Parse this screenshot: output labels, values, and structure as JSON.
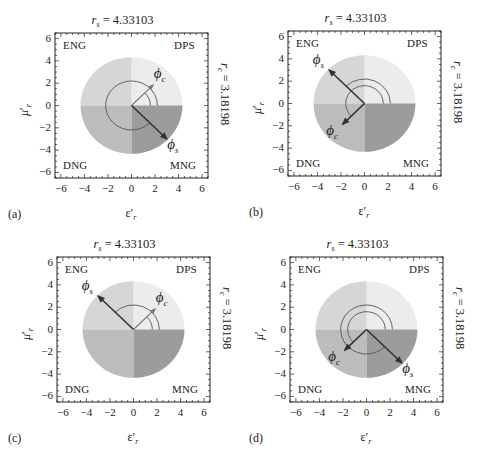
{
  "figure": {
    "colors": {
      "DPS": "#ececec",
      "ENG": "#d6d6d6",
      "DNG": "#bcbcbc",
      "MNG": "#9c9c9c",
      "arrow_dark": "#333333",
      "arrow_gray": "#7a7a7a",
      "arc": "#555555",
      "frame": "#222222"
    }
  },
  "chart_data": [
    {
      "panel": "(a)",
      "type": "scatter",
      "title": "r_s = 4.33103",
      "right_label": "r_c = 3.18198",
      "xlabel": "ε′_r",
      "ylabel": "μ′_r",
      "xlim": [
        -6.5,
        6.5
      ],
      "ylim": [
        -6.5,
        6.5
      ],
      "xticks": [
        -6,
        -4,
        -2,
        0,
        2,
        4,
        6
      ],
      "yticks": [
        -6,
        -4,
        -2,
        0,
        2,
        4,
        6
      ],
      "quadrant_labels": {
        "top_left": "ENG",
        "top_right": "DPS",
        "bottom_left": "DNG",
        "bottom_right": "MNG"
      },
      "disk_radius": 4.33103,
      "phi_c_deg": 45,
      "phi_s_deg": -45,
      "phi_c_arc": {
        "radius": 1.6,
        "from": 0,
        "to": 45
      },
      "phi_s_arc": {
        "radius": 2.2,
        "from": 0,
        "to": 315
      },
      "phi_c_style": "gray",
      "phi_s_style": "dark"
    },
    {
      "panel": "(b)",
      "type": "scatter",
      "title": "r_s = 4.33103",
      "right_label": "r_c = 3.18198",
      "xlabel": "ε′_r",
      "ylabel": "μ′_r",
      "xlim": [
        -6.5,
        6.5
      ],
      "ylim": [
        -6.5,
        6.5
      ],
      "xticks": [
        -6,
        -4,
        -2,
        0,
        2,
        4,
        6
      ],
      "yticks": [
        -6,
        -4,
        -2,
        0,
        2,
        4,
        6
      ],
      "quadrant_labels": {
        "top_left": "ENG",
        "top_right": "DPS",
        "bottom_left": "DNG",
        "bottom_right": "MNG"
      },
      "disk_radius": 4.33103,
      "phi_c_deg": 225,
      "phi_s_deg": 135,
      "phi_c_arc": {
        "radius": 1.6,
        "from": 0,
        "to": 225
      },
      "phi_s_arc": {
        "radius": 2.2,
        "from": 0,
        "to": 135
      },
      "phi_c_style": "dark",
      "phi_s_style": "dark"
    },
    {
      "panel": "(c)",
      "type": "scatter",
      "title": "r_s = 4.33103",
      "right_label": "r_c = 3.18198",
      "xlabel": "ε′_r",
      "ylabel": "μ′_r",
      "xlim": [
        -6.5,
        6.5
      ],
      "ylim": [
        -6.5,
        6.5
      ],
      "xticks": [
        -6,
        -4,
        -2,
        0,
        2,
        4,
        6
      ],
      "yticks": [
        -6,
        -4,
        -2,
        0,
        2,
        4,
        6
      ],
      "quadrant_labels": {
        "top_left": "ENG",
        "top_right": "DPS",
        "bottom_left": "DNG",
        "bottom_right": "MNG"
      },
      "disk_radius": 4.33103,
      "phi_c_deg": 45,
      "phi_s_deg": 135,
      "phi_c_arc": {
        "radius": 1.6,
        "from": 0,
        "to": 45
      },
      "phi_s_arc": {
        "radius": 2.2,
        "from": 0,
        "to": 135
      },
      "phi_c_style": "gray",
      "phi_s_style": "dark"
    },
    {
      "panel": "(d)",
      "type": "scatter",
      "title": "r_s = 4.33103",
      "right_label": "r_c = 3.18198",
      "xlabel": "ε′_r",
      "ylabel": "μ′_r",
      "xlim": [
        -6.5,
        6.5
      ],
      "ylim": [
        -6.5,
        6.5
      ],
      "xticks": [
        -6,
        -4,
        -2,
        0,
        2,
        4,
        6
      ],
      "yticks": [
        -6,
        -4,
        -2,
        0,
        2,
        4,
        6
      ],
      "quadrant_labels": {
        "top_left": "ENG",
        "top_right": "DPS",
        "bottom_left": "DNG",
        "bottom_right": "MNG"
      },
      "disk_radius": 4.33103,
      "phi_c_deg": 225,
      "phi_s_deg": -45,
      "phi_c_arc": {
        "radius": 1.6,
        "from": 0,
        "to": 225
      },
      "phi_s_arc": {
        "radius": 2.2,
        "from": 0,
        "to": 315
      },
      "phi_c_style": "dark",
      "phi_s_style": "dark"
    }
  ],
  "panels": [
    {
      "tag": "(a)",
      "title_r": "r",
      "title_sub": "s",
      "title_val": " = 4.33103",
      "right_r": "r",
      "right_sub": "c",
      "right_val": " = 3.18198",
      "x_sym": "ε",
      "y_sym": "μ",
      "prime": "′",
      "axis_sub": "r",
      "phi": "ϕ",
      "phi_c_sub": "c",
      "phi_s_sub": "s"
    },
    {
      "tag": "(b)",
      "title_r": "r",
      "title_sub": "s",
      "title_val": " = 4.33103",
      "right_r": "r",
      "right_sub": "c",
      "right_val": " = 3.18198",
      "x_sym": "ε",
      "y_sym": "μ",
      "prime": "′",
      "axis_sub": "r",
      "phi": "ϕ",
      "phi_c_sub": "c",
      "phi_s_sub": "s"
    },
    {
      "tag": "(c)",
      "title_r": "r",
      "title_sub": "s",
      "title_val": " = 4.33103",
      "right_r": "r",
      "right_sub": "c",
      "right_val": " = 3.18198",
      "x_sym": "ε",
      "y_sym": "μ",
      "prime": "′",
      "axis_sub": "r",
      "phi": "ϕ",
      "phi_c_sub": "c",
      "phi_s_sub": "s"
    },
    {
      "tag": "(d)",
      "title_r": "r",
      "title_sub": "s",
      "title_val": " = 4.33103",
      "right_r": "r",
      "right_sub": "c",
      "right_val": " = 3.18198",
      "x_sym": "ε",
      "y_sym": "μ",
      "prime": "′",
      "axis_sub": "r",
      "phi": "ϕ",
      "phi_c_sub": "c",
      "phi_s_sub": "s"
    }
  ]
}
